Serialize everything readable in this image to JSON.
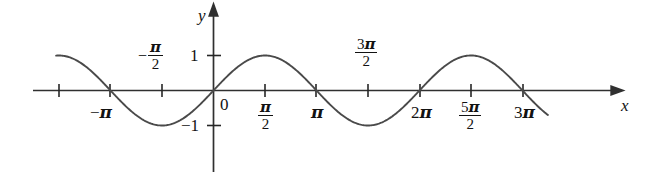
{
  "figure": {
    "background_color": "#ffffff",
    "stroke_color": "#3a3a3a",
    "axis_color": "#303030",
    "text_color": "#121212"
  },
  "axes": {
    "x_axis_label": "x",
    "y_axis_label": "y",
    "origin_label": "0",
    "x_tick_labels": [
      {
        "id": "neg-3pi-over-2",
        "display": "",
        "value": -4.712389,
        "shown": false
      },
      {
        "id": "neg-pi",
        "display": "-π",
        "value": -3.141593,
        "shown": true,
        "position": "below"
      },
      {
        "id": "neg-pi-over-2",
        "display": "-π/2",
        "value": -1.570796,
        "shown": true,
        "position": "above"
      },
      {
        "id": "pi-over-2",
        "display": "π/2",
        "value": 1.570796,
        "shown": true,
        "position": "below"
      },
      {
        "id": "pi",
        "display": "π",
        "value": 3.141593,
        "shown": true,
        "position": "below"
      },
      {
        "id": "three-pi-over-2",
        "display": "3π/2",
        "value": 4.712389,
        "shown": true,
        "position": "above"
      },
      {
        "id": "two-pi",
        "display": "2π",
        "value": 6.283185,
        "shown": true,
        "position": "below"
      },
      {
        "id": "five-pi-over-2",
        "display": "5π/2",
        "value": 7.853982,
        "shown": true,
        "position": "below"
      },
      {
        "id": "three-pi",
        "display": "3π",
        "value": 9.424778,
        "shown": true,
        "position": "below"
      }
    ],
    "y_tick_labels": [
      {
        "id": "y-one",
        "display": "1",
        "value": 1
      },
      {
        "id": "y-neg-one",
        "display": "-1",
        "value": -1
      }
    ]
  },
  "labels": {
    "neg_pi": "−",
    "pi_glyph": "π",
    "minus_glyph": "−",
    "numeral_one": "1",
    "numeral_two": "2",
    "numeral_three": "3",
    "numeral_five": "5",
    "zero": "0",
    "x_var": "x",
    "y_var": "y"
  },
  "chart_data": {
    "type": "line",
    "title": "",
    "xlabel": "x",
    "ylabel": "y",
    "grid": false,
    "legend": null,
    "function": "y = sin(x)",
    "xlim": [
      -4.95,
      10.35
    ],
    "ylim": [
      -1.35,
      1.35
    ],
    "xticks": [
      -4.712389,
      -3.141593,
      -1.570796,
      0,
      1.570796,
      3.141593,
      4.712389,
      6.283185,
      7.853982,
      9.424778
    ],
    "xticklabels": [
      "",
      "−π",
      "−π/2",
      "0",
      "π/2",
      "π",
      "3π/2",
      "2π",
      "5π/2",
      "3π"
    ],
    "yticks": [
      -1,
      1
    ],
    "yticklabels": [
      "−1",
      "1"
    ],
    "series": [
      {
        "name": "sin(x)",
        "x": [
          -4.8,
          -4.4,
          -4.0,
          -3.6,
          -3.2,
          -2.8,
          -2.4,
          -2.0,
          -1.6,
          -1.2,
          -0.8,
          -0.4,
          0.0,
          0.4,
          0.8,
          1.2,
          1.6,
          2.0,
          2.4,
          2.8,
          3.2,
          3.6,
          4.0,
          4.4,
          4.8,
          5.2,
          5.6,
          6.0,
          6.4,
          6.8,
          7.2,
          7.6,
          8.0,
          8.4,
          8.8,
          9.2,
          9.6,
          10.0,
          10.2
        ],
        "y": [
          0.996,
          0.952,
          0.757,
          0.443,
          0.058,
          -0.335,
          -0.675,
          -0.909,
          -1.0,
          -0.932,
          -0.717,
          -0.389,
          0.0,
          0.389,
          0.717,
          0.932,
          1.0,
          0.909,
          0.675,
          0.335,
          -0.058,
          -0.443,
          -0.757,
          -0.952,
          -0.996,
          -0.883,
          -0.631,
          -0.279,
          0.117,
          0.495,
          0.794,
          0.969,
          0.989,
          0.855,
          0.585,
          0.223,
          -0.174,
          -0.544,
          -0.708
        ]
      }
    ]
  }
}
